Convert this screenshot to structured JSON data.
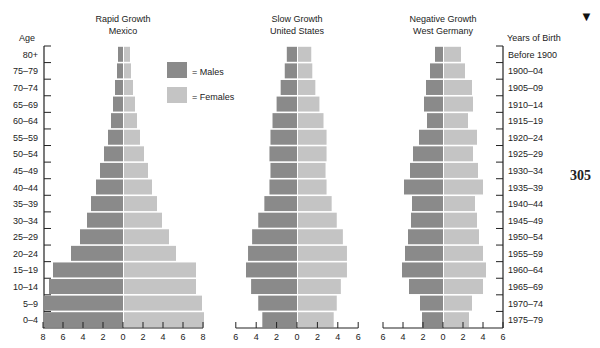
{
  "page": {
    "page_number": "305",
    "marker_glyph": "▼"
  },
  "legend": {
    "males_label": "= Males",
    "females_label": "= Females",
    "males_color": "#8a8a8a",
    "females_color": "#c4c4c4"
  },
  "left_axis": {
    "title": "Age",
    "labels": [
      "80+",
      "75–79",
      "70–74",
      "65–69",
      "60–64",
      "55–59",
      "50–54",
      "45–49",
      "40–44",
      "35–39",
      "30–34",
      "25–29",
      "20–24",
      "15–19",
      "10–14",
      "5–9",
      "0–4"
    ]
  },
  "right_axis": {
    "title": "Years of Birth",
    "labels": [
      "Before 1900",
      "1900–04",
      "1905–09",
      "1910–14",
      "1915–19",
      "1920–24",
      "1925–29",
      "1930–34",
      "1935–39",
      "1940–44",
      "1945–49",
      "1950–54",
      "1955–59",
      "1960–64",
      "1965–69",
      "1970–74",
      "1975–79"
    ]
  },
  "chart_data": [
    {
      "type": "bar",
      "subtype": "population-pyramid",
      "title": "Rapid Growth",
      "subtitle": "Mexico",
      "categories": [
        "80+",
        "75–79",
        "70–74",
        "65–69",
        "60–64",
        "55–59",
        "50–54",
        "45–49",
        "40–44",
        "35–39",
        "30–34",
        "25–29",
        "20–24",
        "15–19",
        "10–14",
        "5–9",
        "0–4"
      ],
      "series": [
        {
          "name": "Males",
          "values": [
            0.5,
            0.6,
            0.8,
            1.0,
            1.2,
            1.5,
            1.9,
            2.3,
            2.7,
            3.2,
            3.6,
            4.3,
            5.2,
            7.0,
            7.4,
            8.0,
            8.0
          ]
        },
        {
          "name": "Females",
          "values": [
            0.6,
            0.7,
            0.9,
            1.1,
            1.3,
            1.6,
            2.0,
            2.4,
            2.8,
            3.3,
            3.8,
            4.5,
            5.2,
            7.2,
            7.2,
            7.8,
            8.0
          ]
        }
      ],
      "xlabel": "",
      "ylabel": "Age",
      "xticks": [
        8,
        6,
        4,
        2,
        0,
        2,
        4,
        6,
        8
      ],
      "xlim": [
        -8,
        8
      ]
    },
    {
      "type": "bar",
      "subtype": "population-pyramid",
      "title": "Slow Growth",
      "subtitle": "United States",
      "categories": [
        "80+",
        "75–79",
        "70–74",
        "65–69",
        "60–64",
        "55–59",
        "50–54",
        "45–49",
        "40–44",
        "35–39",
        "30–34",
        "25–29",
        "20–24",
        "15–19",
        "10–14",
        "5–9",
        "0–4"
      ],
      "series": [
        {
          "name": "Males",
          "values": [
            1.0,
            1.2,
            1.6,
            2.0,
            2.4,
            2.6,
            2.7,
            2.6,
            2.7,
            3.2,
            3.8,
            4.4,
            4.8,
            5.0,
            4.5,
            3.8,
            3.4
          ]
        },
        {
          "name": "Females",
          "values": [
            1.3,
            1.4,
            1.7,
            2.1,
            2.5,
            2.8,
            2.8,
            2.7,
            2.8,
            3.3,
            3.8,
            4.4,
            4.8,
            4.8,
            4.2,
            3.8,
            3.5
          ]
        }
      ],
      "xlabel": "",
      "ylabel": "Age",
      "xticks": [
        6,
        4,
        2,
        0,
        2,
        4,
        6
      ],
      "xlim": [
        -6,
        6
      ]
    },
    {
      "type": "bar",
      "subtype": "population-pyramid",
      "title": "Negative Growth",
      "subtitle": "West Germany",
      "categories": [
        "Before 1900",
        "1900–04",
        "1905–09",
        "1910–14",
        "1915–19",
        "1920–24",
        "1925–29",
        "1930–34",
        "1935–39",
        "1940–44",
        "1945–49",
        "1950–54",
        "1955–59",
        "1960–64",
        "1965–69",
        "1970–74",
        "1975–79"
      ],
      "series": [
        {
          "name": "Males",
          "values": [
            0.8,
            1.3,
            1.7,
            1.9,
            1.6,
            2.4,
            3.0,
            3.3,
            3.9,
            3.1,
            3.2,
            3.5,
            3.8,
            4.1,
            3.4,
            2.3,
            2.1
          ]
        },
        {
          "name": "Females",
          "values": [
            1.7,
            2.1,
            2.8,
            2.9,
            2.4,
            3.3,
            2.9,
            3.4,
            3.9,
            3.1,
            3.3,
            3.5,
            3.9,
            4.2,
            3.9,
            2.8,
            2.5
          ]
        }
      ],
      "xlabel": "",
      "ylabel": "Years of Birth",
      "xticks": [
        6,
        4,
        2,
        0,
        2,
        4,
        6
      ],
      "xlim": [
        -6,
        6
      ]
    }
  ]
}
